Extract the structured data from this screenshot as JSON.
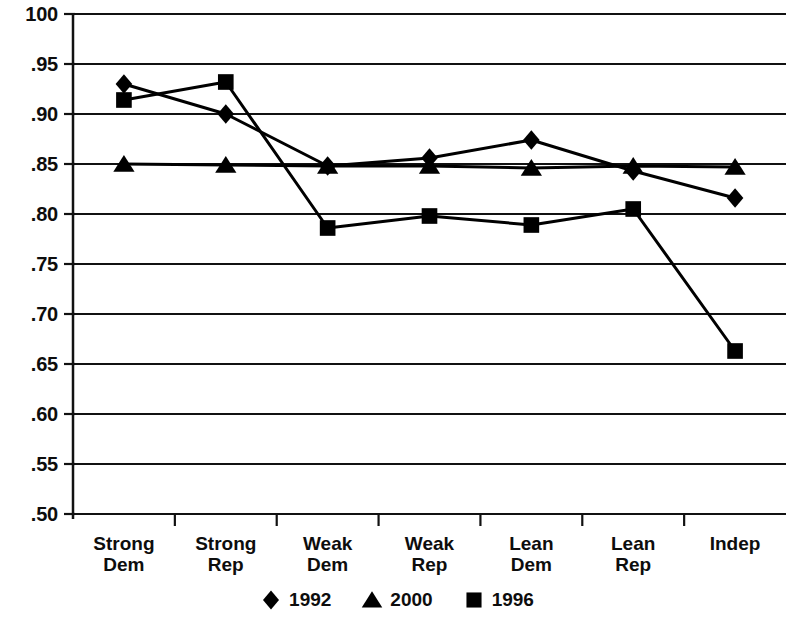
{
  "chart_data": {
    "type": "line",
    "title": "",
    "subtitle": "",
    "xlabel": "",
    "ylabel": "",
    "categories": [
      "Strong Dem",
      "Strong Rep",
      "Weak Dem",
      "Weak Rep",
      "Lean Dem",
      "Lean Rep",
      "Indep"
    ],
    "category_lines": [
      [
        "Strong",
        "Dem"
      ],
      [
        "Strong",
        "Rep"
      ],
      [
        "Weak",
        "Dem"
      ],
      [
        "Weak",
        "Rep"
      ],
      [
        "Lean",
        "Dem"
      ],
      [
        "Lean",
        "Rep"
      ],
      [
        "Indep",
        ""
      ]
    ],
    "series": [
      {
        "name": "1992",
        "marker": "diamond",
        "color": "#000000",
        "values": [
          0.93,
          0.9,
          0.848,
          0.856,
          0.874,
          0.843,
          0.816
        ]
      },
      {
        "name": "2000",
        "marker": "triangle",
        "color": "#000000",
        "values": [
          0.85,
          0.849,
          0.848,
          0.848,
          0.846,
          0.848,
          0.847
        ]
      },
      {
        "name": "1996",
        "marker": "square",
        "color": "#000000",
        "values": [
          0.914,
          0.932,
          0.786,
          0.798,
          0.789,
          0.805,
          0.663
        ]
      }
    ],
    "ylim": [
      0.5,
      1.0
    ],
    "ytick_values": [
      1.0,
      0.95,
      0.9,
      0.85,
      0.8,
      0.75,
      0.7,
      0.65,
      0.6,
      0.55,
      0.5
    ],
    "ytick_labels": [
      "100",
      ".95",
      ".90",
      ".85",
      ".80",
      ".75",
      ".70",
      ".65",
      ".60",
      ".55",
      ".50"
    ],
    "grid": true,
    "grid_axis": "y",
    "legend_position": "bottom",
    "legend_order": [
      "1992",
      "2000",
      "1996"
    ]
  },
  "legend": {
    "entries": [
      {
        "label": "1992",
        "marker": "diamond"
      },
      {
        "label": "2000",
        "marker": "triangle"
      },
      {
        "label": "1996",
        "marker": "square"
      }
    ]
  }
}
